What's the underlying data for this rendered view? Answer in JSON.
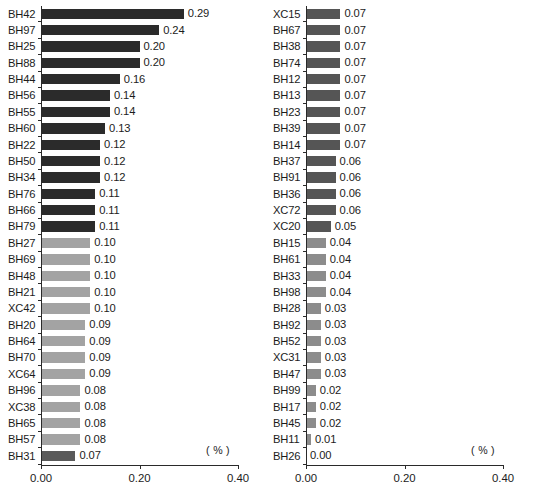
{
  "chart_data": [
    {
      "type": "bar",
      "orientation": "horizontal",
      "panel": "left",
      "title": "",
      "xlabel": "( % )",
      "ylabel": "",
      "xlim": [
        0.0,
        0.4
      ],
      "xticks": [
        "0.00",
        "0.20",
        "0.40"
      ],
      "xtick_values": [
        0.0,
        0.2,
        0.4
      ],
      "grid": false,
      "unit_label": "( % )",
      "categories": [
        "BH42",
        "BH97",
        "BH25",
        "BH88",
        "BH44",
        "BH56",
        "BH55",
        "BH60",
        "BH22",
        "BH50",
        "BH34",
        "BH76",
        "BH66",
        "BH79",
        "BH27",
        "BH69",
        "BH48",
        "BH21",
        "XC42",
        "BH20",
        "BH64",
        "BH70",
        "XC64",
        "BH96",
        "XC38",
        "BH65",
        "BH57",
        "BH31"
      ],
      "values": [
        0.29,
        0.24,
        0.2,
        0.2,
        0.16,
        0.14,
        0.14,
        0.13,
        0.12,
        0.12,
        0.12,
        0.11,
        0.11,
        0.11,
        0.1,
        0.1,
        0.1,
        0.1,
        0.1,
        0.09,
        0.09,
        0.09,
        0.09,
        0.08,
        0.08,
        0.08,
        0.08,
        0.07
      ],
      "value_labels": [
        "0.29",
        "0.24",
        "0.20",
        "0.20",
        "0.16",
        "0.14",
        "0.14",
        "0.13",
        "0.12",
        "0.12",
        "0.12",
        "0.11",
        "0.11",
        "0.11",
        "0.10",
        "0.10",
        "0.10",
        "0.10",
        "0.10",
        "0.09",
        "0.09",
        "0.09",
        "0.09",
        "0.08",
        "0.08",
        "0.08",
        "0.08",
        "0.07"
      ],
      "tones": [
        "dark",
        "dark",
        "dark",
        "dark",
        "dark",
        "dark",
        "dark",
        "dark",
        "dark",
        "dark",
        "dark",
        "dark",
        "dark",
        "dark",
        "light",
        "light",
        "light",
        "light",
        "light",
        "light",
        "light",
        "light",
        "light",
        "light",
        "light",
        "light",
        "light",
        "mid"
      ]
    },
    {
      "type": "bar",
      "orientation": "horizontal",
      "panel": "right",
      "title": "",
      "xlabel": "( % )",
      "ylabel": "",
      "xlim": [
        0.0,
        0.4
      ],
      "xticks": [
        "0.00",
        "0.20",
        "0.40"
      ],
      "xtick_values": [
        0.0,
        0.2,
        0.4
      ],
      "grid": false,
      "unit_label": "( % )",
      "categories": [
        "XC15",
        "BH67",
        "BH38",
        "BH74",
        "BH12",
        "BH13",
        "BH23",
        "BH39",
        "BH14",
        "BH37",
        "BH91",
        "BH36",
        "XC72",
        "XC20",
        "BH15",
        "BH61",
        "BH33",
        "BH98",
        "BH28",
        "BH92",
        "BH52",
        "XC31",
        "BH47",
        "BH99",
        "BH17",
        "BH45",
        "BH11",
        "BH26"
      ],
      "values": [
        0.07,
        0.07,
        0.07,
        0.07,
        0.07,
        0.07,
        0.07,
        0.07,
        0.07,
        0.06,
        0.06,
        0.06,
        0.06,
        0.05,
        0.04,
        0.04,
        0.04,
        0.04,
        0.03,
        0.03,
        0.03,
        0.03,
        0.03,
        0.02,
        0.02,
        0.02,
        0.01,
        0.0
      ],
      "value_labels": [
        "0.07",
        "0.07",
        "0.07",
        "0.07",
        "0.07",
        "0.07",
        "0.07",
        "0.07",
        "0.07",
        "0.06",
        "0.06",
        "0.06",
        "0.06",
        "0.05",
        "0.04",
        "0.04",
        "0.04",
        "0.04",
        "0.03",
        "0.03",
        "0.03",
        "0.03",
        "0.03",
        "0.02",
        "0.02",
        "0.02",
        "0.01",
        "0.00"
      ],
      "tones": [
        "rdark",
        "rdark",
        "rdark",
        "rdark",
        "rdark",
        "rdark",
        "rdark",
        "rdark",
        "rdark",
        "rdark",
        "rdark",
        "rdark",
        "rdark",
        "rdark",
        "rlight",
        "rlight",
        "rlight",
        "rlight",
        "rlight",
        "rlight",
        "rlight",
        "rlight",
        "rlight",
        "rlight",
        "rlight",
        "rlight",
        "rlight",
        "none"
      ]
    }
  ],
  "colors": {
    "bar_dark": "#2b2b2b",
    "bar_mid": "#5a5a5a",
    "bar_light": "#a3a3a3",
    "bar_right_dark": "#555555",
    "bar_right_light": "#8c8c8c",
    "axis": "#2a2a2a",
    "text": "#1c1c1c",
    "background": "#ffffff"
  },
  "caption": {
    "text": ""
  }
}
